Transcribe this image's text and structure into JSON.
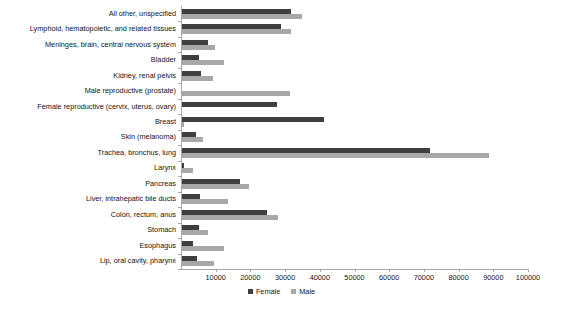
{
  "chart_data": {
    "type": "bar",
    "orientation": "horizontal",
    "title": "",
    "xlabel": "",
    "ylabel": "",
    "xlim": [
      0,
      100000
    ],
    "xticks": [
      10000,
      20000,
      30000,
      40000,
      50000,
      60000,
      70000,
      80000,
      90000,
      100000
    ],
    "xtick_labels": [
      "10000",
      "20000",
      "30000",
      "40000",
      "50000",
      "60000",
      "70000",
      "80000",
      "90000",
      "100000"
    ],
    "grid": false,
    "legend_position": "bottom",
    "categories": [
      "All other, unspecified",
      "Lymphoid, hematopoietic, and related tissues",
      "Meninges, brain, central nervous system",
      "Bladder",
      "Kidney, renal pelvis",
      "Male reproductive (prostate)",
      "Female reproductive (cervix, uterus, ovary)",
      "Breast",
      "Skin (melanoma)",
      "Trachea, bronchus, lung",
      "Larynx",
      "Pancreas",
      "Liver, intrahepatic bile ducts",
      "Colon, rectum, anus",
      "Stomach",
      "Esophagus",
      "Lip, oral cavity, pharynx"
    ],
    "series": [
      {
        "name": "Female",
        "color": "#3f3f3f",
        "values": [
          31500,
          28500,
          7500,
          4800,
          5500,
          0,
          27500,
          41000,
          3900,
          71500,
          700,
          16800,
          5100,
          24600,
          4900,
          3100,
          4200
        ]
      },
      {
        "name": "Male",
        "color": "#a8a8a8",
        "values": [
          34500,
          31500,
          9500,
          12200,
          8800,
          31200,
          0,
          500,
          6100,
          88500,
          3100,
          19200,
          13400,
          27800,
          7600,
          12200,
          9300
        ]
      }
    ],
    "legend": [
      {
        "label": "Female",
        "color": "#3f3f3f",
        "swatch": "square-swatch"
      },
      {
        "label": "Male",
        "color": "#a8a8a8",
        "swatch": "square-swatch"
      }
    ]
  }
}
